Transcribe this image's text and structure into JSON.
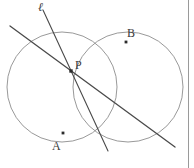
{
  "figure": {
    "background_color": "#ffffff",
    "width": 194,
    "height": 168,
    "border": {
      "side": "right",
      "x": 188,
      "color": "#9a9a9a"
    },
    "labels": {
      "line_ell": "ℓ",
      "point_p": "P",
      "point_a": "A",
      "point_b": "B"
    },
    "colors": {
      "arc_stroke": "#8d8d8d",
      "line_stroke": "#4a4a4a",
      "label_text": "#3a3a3a",
      "dot_fill": "#2b2b2b"
    },
    "points": [
      {
        "name": "P",
        "label": "P",
        "x": 71,
        "y": 71,
        "marked": true
      },
      {
        "name": "A",
        "label": "A",
        "x": 63,
        "y": 133,
        "marked": true
      },
      {
        "name": "B",
        "label": "B",
        "x": 126,
        "y": 42,
        "marked": true
      }
    ],
    "circles": [
      {
        "name": "left-circle",
        "cx": 62,
        "cy": 87,
        "r": 55
      },
      {
        "name": "right-circle",
        "cx": 128,
        "cy": 87,
        "r": 55
      }
    ],
    "intersections": [
      {
        "name": "upper-left-intersection",
        "x": 32,
        "y": 41
      },
      {
        "name": "lower-right-intersection",
        "x": 158,
        "y": 133
      }
    ],
    "lines": [
      {
        "name": "radical-axis-line",
        "label": "",
        "x1": 10,
        "y1": 26,
        "x2": 175,
        "y2": 147,
        "stroke_width": 1.3
      },
      {
        "name": "line-ell",
        "label": "ℓ",
        "x1": 43,
        "y1": 10,
        "x2": 108,
        "y2": 151,
        "stroke_width": 1.1
      }
    ]
  }
}
